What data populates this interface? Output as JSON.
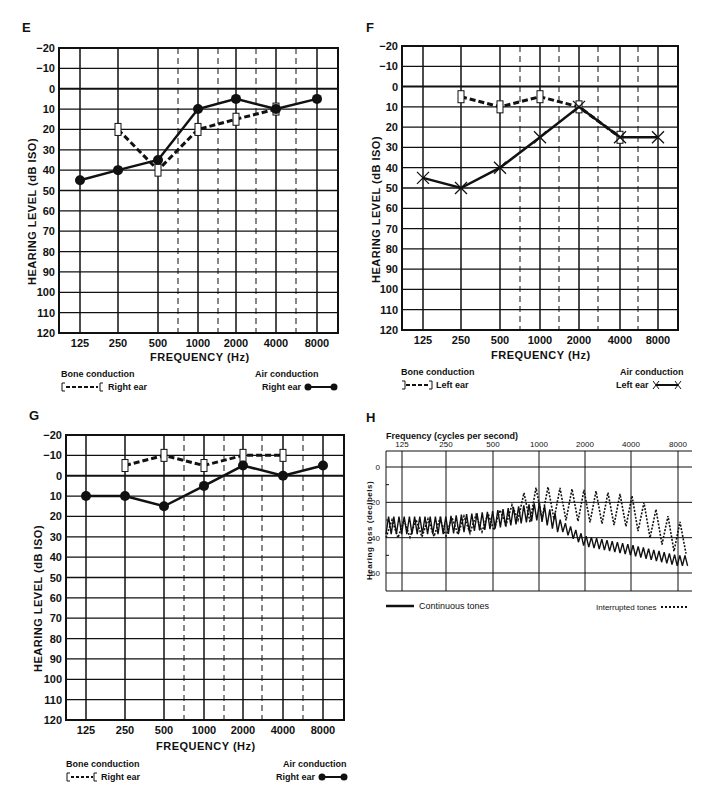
{
  "chart_data": [
    {
      "panel": "E",
      "type": "line",
      "xlabel": "FREQUENCY (Hz)",
      "ylabel": "HEARING LEVEL (dB ISO)",
      "categories": [
        "125",
        "250",
        "500",
        "1000",
        "2000",
        "4000",
        "8000"
      ],
      "y_ticks": [
        "-20",
        "-10",
        "0",
        "10",
        "20",
        "30",
        "40",
        "50",
        "60",
        "70",
        "80",
        "90",
        "100",
        "110",
        "120"
      ],
      "ylim": [
        -20,
        120
      ],
      "y_inverted": true,
      "series": [
        {
          "name": "Air conduction Right ear",
          "marker": "filled-circle",
          "style": "solid",
          "x": [
            "125",
            "250",
            "500",
            "1000",
            "2000",
            "4000",
            "8000"
          ],
          "values": [
            45,
            40,
            35,
            10,
            5,
            10,
            5
          ]
        },
        {
          "name": "Bone conduction Right ear",
          "marker": "bracket-left",
          "style": "dashed",
          "x": [
            "250",
            "500",
            "1000",
            "2000",
            "4000"
          ],
          "values": [
            20,
            40,
            20,
            15,
            10
          ]
        }
      ],
      "legend": {
        "bone_title": "Bone conduction",
        "bone_label": "Right ear",
        "air_title": "Air conduction",
        "air_label": "Right ear"
      }
    },
    {
      "panel": "F",
      "type": "line",
      "xlabel": "FREQUENCY (Hz)",
      "ylabel": "HEARING LEVEL (dB ISO)",
      "categories": [
        "125",
        "250",
        "500",
        "1000",
        "2000",
        "4000",
        "8000"
      ],
      "y_ticks": [
        "-20",
        "-10",
        "0",
        "10",
        "20",
        "30",
        "40",
        "50",
        "60",
        "70",
        "80",
        "90",
        "100",
        "110",
        "120"
      ],
      "ylim": [
        -20,
        120
      ],
      "y_inverted": true,
      "series": [
        {
          "name": "Air conduction Left ear",
          "marker": "x",
          "style": "solid",
          "x": [
            "125",
            "250",
            "500",
            "1000",
            "2000",
            "4000",
            "8000"
          ],
          "values": [
            45,
            50,
            40,
            25,
            10,
            25,
            25
          ]
        },
        {
          "name": "Bone conduction Left ear",
          "marker": "bracket-right",
          "style": "dashed",
          "x": [
            "250",
            "500",
            "1000",
            "2000",
            "4000"
          ],
          "values": [
            5,
            10,
            5,
            10,
            25
          ]
        }
      ],
      "legend": {
        "bone_title": "Bone conduction",
        "bone_label": "Left ear",
        "air_title": "Air conduction",
        "air_label": "Left ear"
      }
    },
    {
      "panel": "G",
      "type": "line",
      "xlabel": "FREQUENCY (Hz)",
      "ylabel": "HEARING LEVEL (dB ISO)",
      "categories": [
        "125",
        "250",
        "500",
        "1000",
        "2000",
        "4000",
        "8000"
      ],
      "y_ticks": [
        "-20",
        "-10",
        "0",
        "10",
        "20",
        "30",
        "40",
        "50",
        "60",
        "70",
        "80",
        "90",
        "100",
        "110",
        "120"
      ],
      "ylim": [
        -20,
        120
      ],
      "y_inverted": true,
      "series": [
        {
          "name": "Air conduction Right ear",
          "marker": "filled-circle",
          "style": "solid",
          "x": [
            "125",
            "250",
            "500",
            "1000",
            "2000",
            "4000",
            "8000"
          ],
          "values": [
            10,
            10,
            15,
            5,
            -5,
            0,
            -5
          ]
        },
        {
          "name": "Bone conduction Right ear",
          "marker": "bracket-left",
          "style": "dashed",
          "x": [
            "250",
            "500",
            "1000",
            "2000",
            "4000"
          ],
          "values": [
            -5,
            -10,
            -5,
            -10,
            -10
          ]
        }
      ],
      "legend": {
        "bone_title": "Bone conduction",
        "bone_label": "Right ear",
        "air_title": "Air conduction",
        "air_label": "Right ear"
      }
    },
    {
      "panel": "H",
      "type": "line",
      "title": "Frequency (cycles per second)",
      "xlabel": "Frequency (cycles per second)",
      "ylabel": "Hearing loss (decibels)",
      "categories": [
        "125",
        "250",
        "500",
        "1000",
        "2000",
        "4000",
        "8000"
      ],
      "y_ticks": [
        "0",
        "20",
        "40",
        "60"
      ],
      "ylim": [
        -9,
        70
      ],
      "y_inverted": true,
      "series": [
        {
          "name": "Continuous tones",
          "style": "solid-zigzag",
          "x": [
            "125",
            "250",
            "500",
            "1000",
            "2000",
            "4000",
            "8000"
          ],
          "values": [
            33,
            33,
            30,
            25,
            42,
            47,
            53
          ]
        },
        {
          "name": "Interrupted tones",
          "style": "dotted-zigzag",
          "x": [
            "125",
            "250",
            "500",
            "1000",
            "2000",
            "4000",
            "8000"
          ],
          "values": [
            35,
            34,
            31,
            20,
            22,
            25,
            40
          ]
        }
      ],
      "legend": {
        "continuous_label": "Continuous tones",
        "interrupted_label": "Interrupted tones"
      }
    }
  ]
}
